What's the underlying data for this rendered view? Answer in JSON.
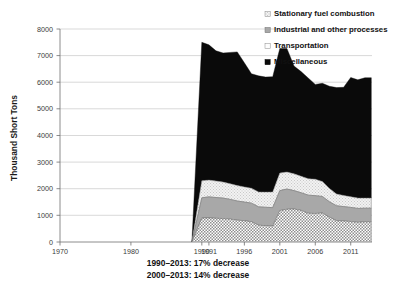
{
  "chart_data": {
    "type": "area",
    "title": "",
    "subtitle": "",
    "xlabel": "",
    "ylabel": "Thousand Short Tons",
    "ylim": [
      0,
      8000
    ],
    "xlim": [
      1970,
      2014
    ],
    "grid": true,
    "stacked": true,
    "legend_position": "top-right",
    "y_ticks": [
      0,
      1000,
      2000,
      3000,
      4000,
      5000,
      6000,
      7000,
      8000
    ],
    "y_tick_labels": [
      "0",
      "1000",
      "2000",
      "3000",
      "4000",
      "5000",
      "6000",
      "7000",
      "8000"
    ],
    "x_ticks": [
      1970,
      1980,
      1990,
      1991,
      1996,
      2001,
      2006,
      2011
    ],
    "x_tick_labels": [
      "1970",
      "1980",
      "1990",
      "1991",
      "1996",
      "2001",
      "2006",
      "2011"
    ],
    "x": [
      1990,
      1991,
      1992,
      1993,
      1994,
      1995,
      1996,
      1997,
      1998,
      1999,
      2000,
      2001,
      2002,
      2003,
      2004,
      2005,
      2006,
      2007,
      2008,
      2009,
      2010,
      2011,
      2012,
      2013
    ],
    "series": [
      {
        "name": "Miscellaneous",
        "fill": "halftone-dark-gray",
        "values": [
          900,
          905,
          890,
          880,
          860,
          820,
          800,
          760,
          630,
          615,
          600,
          1180,
          1230,
          1240,
          1190,
          1080,
          1070,
          1090,
          930,
          800,
          790,
          770,
          740,
          760
        ]
      },
      {
        "name": "Transportation",
        "fill": "solid-gray",
        "values": [
          760,
          790,
          780,
          770,
          740,
          720,
          700,
          700,
          690,
          690,
          690,
          750,
          760,
          690,
          660,
          680,
          670,
          620,
          580,
          560,
          540,
          530,
          520,
          510
        ]
      },
      {
        "name": "Industrial and other processes",
        "fill": "light-gray",
        "values": [
          640,
          630,
          620,
          600,
          590,
          580,
          570,
          560,
          560,
          570,
          590,
          660,
          640,
          630,
          620,
          620,
          620,
          560,
          500,
          440,
          420,
          400,
          390,
          380
        ]
      },
      {
        "name": "Stationary fuel combustion",
        "fill": "solid-black",
        "values": [
          5200,
          5080,
          4890,
          4850,
          4930,
          5020,
          4660,
          4300,
          4360,
          4320,
          4330,
          4680,
          4640,
          4050,
          3930,
          3780,
          3560,
          3690,
          3840,
          4000,
          4060,
          4480,
          4440,
          4520
        ]
      }
    ],
    "totals": [
      7500,
      7405,
      7180,
      7100,
      7120,
      7140,
      6730,
      6320,
      6240,
      6195,
      6210,
      7270,
      7270,
      6610,
      6400,
      6160,
      5920,
      5960,
      5850,
      5800,
      5810,
      6180,
      6090,
      6170
    ],
    "annotations": [
      "1990–2013: 17% decrease",
      "2000–2013: 14% decrease"
    ]
  },
  "legend": {
    "items": [
      {
        "label": "Stationary fuel combustion",
        "marker": "swatch-light-gray"
      },
      {
        "label": "Industrial and other processes",
        "marker": "swatch-medium-gray"
      },
      {
        "label": "Transportation",
        "marker": "swatch-white"
      },
      {
        "label": "Miscellaneous",
        "marker": "swatch-black"
      }
    ]
  },
  "colors": {
    "black": "#0a0a0a",
    "light_gray": "#ececec",
    "medium_gray": "#a8a8a8",
    "halftone_gray": "#b4b4b4",
    "gridline": "#c8c8c8",
    "axis": "#6e6e6e",
    "text": "#1a1a1a",
    "tick_text": "#3b3b3b"
  }
}
